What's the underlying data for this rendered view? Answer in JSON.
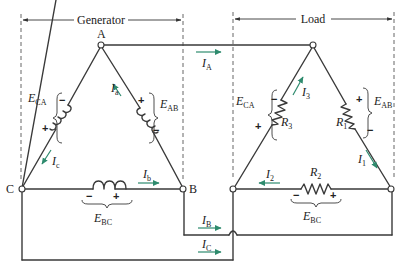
{
  "sections": {
    "generator": {
      "label": "Generator"
    },
    "load": {
      "label": "Load"
    }
  },
  "nodes": {
    "A": "A",
    "B": "B",
    "C": "C"
  },
  "generator": {
    "E_AB": {
      "main": "E",
      "sub": "AB"
    },
    "E_BC": {
      "main": "E",
      "sub": "BC"
    },
    "E_CA": {
      "main": "E",
      "sub": "CA"
    },
    "I_a": {
      "main": "I",
      "sub": "a"
    },
    "I_b": {
      "main": "I",
      "sub": "b"
    },
    "I_c": {
      "main": "I",
      "sub": "c"
    }
  },
  "lines": {
    "I_A": {
      "main": "I",
      "sub": "A"
    },
    "I_B": {
      "main": "I",
      "sub": "B"
    },
    "I_C": {
      "main": "I",
      "sub": "C"
    }
  },
  "load": {
    "E_AB": {
      "main": "E",
      "sub": "AB"
    },
    "E_BC": {
      "main": "E",
      "sub": "BC"
    },
    "E_CA": {
      "main": "E",
      "sub": "CA"
    },
    "R1": {
      "main": "R",
      "sub": "1"
    },
    "R2": {
      "main": "R",
      "sub": "2"
    },
    "R3": {
      "main": "R",
      "sub": "3"
    },
    "I1": {
      "main": "I",
      "sub": "1"
    },
    "I2": {
      "main": "I",
      "sub": "2"
    },
    "I3": {
      "main": "I",
      "sub": "3"
    }
  },
  "signs": {
    "plus": "+",
    "minus": "−"
  },
  "colors": {
    "wire": "#3a3a3a",
    "current_arrow": "#2e8b6e"
  }
}
